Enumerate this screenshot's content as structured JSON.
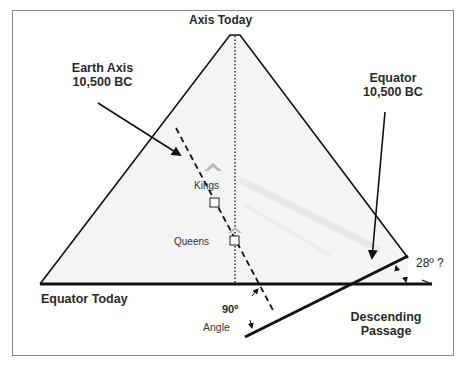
{
  "diagram": {
    "labels": {
      "axis_today": "Axis Today",
      "earth_axis_line1": "Earth Axis",
      "earth_axis_line2": "10,500 BC",
      "equator_bc_line1": "Equator",
      "equator_bc_line2": "10,500 BC",
      "kings": "Kings",
      "queens": "Queens",
      "equator_today": "Equator Today",
      "angle_value": "90º",
      "angle_word": "Angle",
      "tilt_angle": "28º ?",
      "descending_line1": "Descending",
      "descending_line2": "Passage"
    },
    "colors": {
      "line": "#111111",
      "pyramid_fill": "#f4f4f4",
      "frame": "#8a8a8a",
      "chamber_marker": "#b8b8b8"
    }
  }
}
